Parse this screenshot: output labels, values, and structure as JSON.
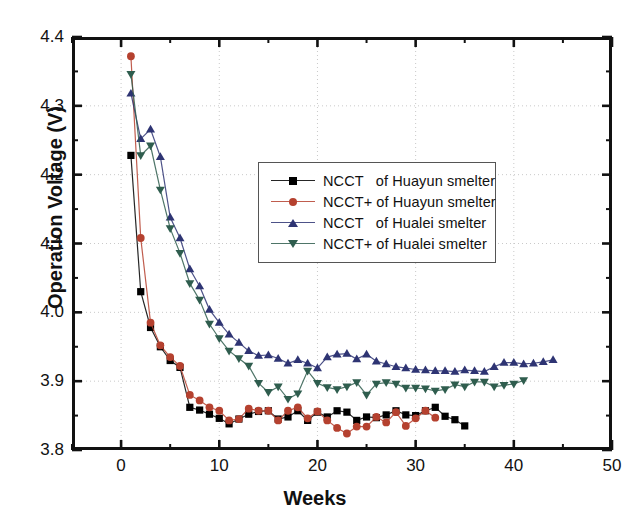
{
  "chart_data": {
    "type": "line",
    "title": "",
    "xlabel": "Weeks",
    "ylabel": "Operation Voltage (V)",
    "xlim": [
      -5,
      50
    ],
    "ylim": [
      3.8,
      4.4
    ],
    "xticks": [
      0,
      10,
      20,
      30,
      40,
      50
    ],
    "xtick_labels": [
      "0",
      "10",
      "20",
      "30",
      "40",
      "50"
    ],
    "xminor_step": 5,
    "yticks": [
      3.8,
      3.9,
      4.0,
      4.1,
      4.2,
      4.3,
      4.4
    ],
    "ytick_labels": [
      "3.8",
      "3.9",
      "4.0",
      "4.1",
      "4.2",
      "4.3",
      "4.4"
    ],
    "yminor_step": 0.05,
    "grid": "dotted-light-at-major-ticks",
    "legend_position": "upper-center-right",
    "series": [
      {
        "name": "NCCT   of Huayun smelter",
        "color": "#000000",
        "marker": "square",
        "x": [
          1,
          2,
          3,
          4,
          5,
          6,
          7,
          8,
          9,
          10,
          11,
          12,
          13,
          14,
          15,
          16,
          17,
          18,
          19,
          20,
          21,
          22,
          23,
          24,
          25,
          26,
          27,
          28,
          29,
          30,
          31,
          32,
          33,
          34,
          35
        ],
        "y": [
          4.228,
          4.03,
          3.978,
          3.95,
          3.93,
          3.92,
          3.862,
          3.858,
          3.852,
          3.846,
          3.838,
          3.845,
          3.852,
          3.856,
          3.857,
          3.845,
          3.848,
          3.857,
          3.843,
          3.855,
          3.848,
          3.857,
          3.855,
          3.843,
          3.848,
          3.847,
          3.851,
          3.857,
          3.851,
          3.85,
          3.857,
          3.862,
          3.849,
          3.844,
          3.835
        ]
      },
      {
        "name": "NCCT+ of Huayun smelter",
        "color": "#b5412f",
        "marker": "circle",
        "x": [
          1,
          2,
          3,
          4,
          5,
          6,
          7,
          8,
          9,
          10,
          11,
          12,
          13,
          14,
          15,
          16,
          17,
          18,
          19,
          20,
          21,
          22,
          23,
          24,
          25,
          26,
          27,
          28,
          29,
          30,
          31,
          32
        ],
        "y": [
          4.372,
          4.108,
          3.985,
          3.952,
          3.935,
          3.922,
          3.88,
          3.872,
          3.862,
          3.857,
          3.843,
          3.845,
          3.86,
          3.857,
          3.857,
          3.843,
          3.857,
          3.862,
          3.846,
          3.856,
          3.843,
          3.832,
          3.824,
          3.834,
          3.834,
          3.848,
          3.84,
          3.855,
          3.835,
          3.846,
          3.857,
          3.847
        ]
      },
      {
        "name": "NCCT   of Hualei smelter",
        "color": "#2e3473",
        "marker": "triangle-up",
        "x": [
          1,
          2,
          3,
          4,
          5,
          6,
          7,
          8,
          9,
          10,
          11,
          12,
          13,
          14,
          15,
          16,
          17,
          18,
          19,
          20,
          21,
          22,
          23,
          24,
          25,
          26,
          27,
          28,
          29,
          30,
          31,
          32,
          33,
          34,
          35,
          36,
          37,
          38,
          39,
          40,
          41,
          42,
          43,
          44
        ],
        "y": [
          4.318,
          4.252,
          4.266,
          4.226,
          4.138,
          4.108,
          4.063,
          4.038,
          4.004,
          3.985,
          3.968,
          3.956,
          3.944,
          3.937,
          3.938,
          3.933,
          3.926,
          3.931,
          3.926,
          3.919,
          3.935,
          3.939,
          3.94,
          3.932,
          3.939,
          3.929,
          3.925,
          3.921,
          3.919,
          3.917,
          3.916,
          3.915,
          3.915,
          3.914,
          3.916,
          3.915,
          3.914,
          3.921,
          3.927,
          3.927,
          3.925,
          3.926,
          3.928,
          3.931
        ]
      },
      {
        "name": "NCCT+ of Hualei smelter",
        "color": "#2f5d4e",
        "marker": "triangle-down",
        "x": [
          1,
          2,
          3,
          4,
          5,
          6,
          7,
          8,
          9,
          10,
          11,
          12,
          13,
          14,
          15,
          16,
          17,
          18,
          19,
          20,
          21,
          22,
          23,
          24,
          25,
          26,
          27,
          28,
          29,
          30,
          31,
          32,
          33,
          34,
          35,
          36,
          37,
          38,
          39,
          40,
          41
        ],
        "y": [
          4.346,
          4.228,
          4.242,
          4.178,
          4.122,
          4.086,
          4.042,
          4.018,
          3.983,
          3.962,
          3.944,
          3.933,
          3.922,
          3.897,
          3.884,
          3.892,
          3.874,
          3.882,
          3.915,
          3.897,
          3.891,
          3.888,
          3.892,
          3.898,
          3.88,
          3.896,
          3.898,
          3.896,
          3.89,
          3.89,
          3.889,
          3.886,
          3.888,
          3.895,
          3.892,
          3.899,
          3.899,
          3.892,
          3.894,
          3.896,
          3.901
        ]
      }
    ]
  },
  "axes": {
    "ylabel": "Operation Voltage (V)",
    "xlabel": "Weeks"
  },
  "legend": {
    "items": [
      {
        "label": "NCCT   of Huayun smelter",
        "color": "#000000",
        "marker": "square"
      },
      {
        "label": "NCCT+ of Huayun smelter",
        "color": "#b5412f",
        "marker": "circle"
      },
      {
        "label": "NCCT   of Hualei smelter",
        "color": "#2e3473",
        "marker": "triangle-up"
      },
      {
        "label": "NCCT+ of Hualei smelter",
        "color": "#2f5d4e",
        "marker": "triangle-down"
      }
    ]
  }
}
